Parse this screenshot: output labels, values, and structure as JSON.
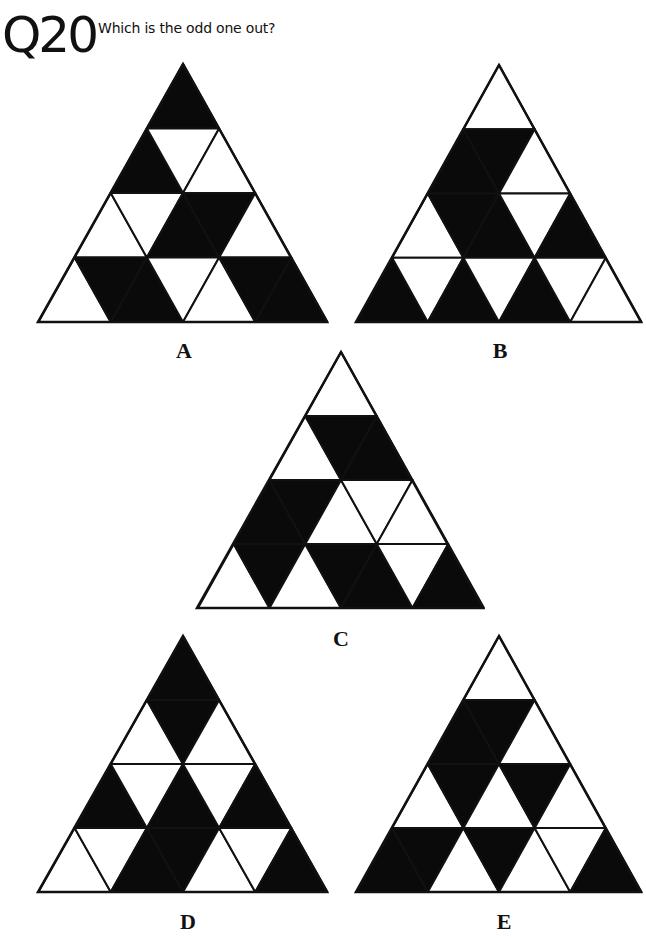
{
  "header": {
    "question_number": "Q20",
    "prompt": "Which is the odd one out?"
  },
  "colors": {
    "fill_black": "#0a0a0a",
    "fill_white": "#ffffff",
    "stroke": "#111111",
    "background": "#ffffff"
  },
  "fill_encoding": "rows top-to-bottom; each row lists cells left-to-right alternating up/down triangles; 1 = black, 0 = white",
  "options": [
    {
      "label": "A",
      "apex": [
        183,
        64
      ],
      "base_left": [
        38,
        322
      ],
      "base_right": [
        327,
        322
      ],
      "label_pos": [
        184,
        340
      ],
      "rows": [
        [
          1
        ],
        [
          1,
          0,
          0
        ],
        [
          0,
          0,
          1,
          1,
          0
        ],
        [
          0,
          1,
          1,
          0,
          0,
          1,
          1
        ]
      ]
    },
    {
      "label": "B",
      "apex": [
        499,
        65
      ],
      "base_left": [
        356,
        322
      ],
      "base_right": [
        641,
        322
      ],
      "label_pos": [
        500,
        340
      ],
      "rows": [
        [
          0
        ],
        [
          1,
          1,
          0
        ],
        [
          0,
          1,
          1,
          0,
          1
        ],
        [
          1,
          0,
          1,
          0,
          1,
          0,
          0
        ]
      ]
    },
    {
      "label": "C",
      "apex": [
        341,
        352
      ],
      "base_left": [
        197,
        608
      ],
      "base_right": [
        483,
        608
      ],
      "label_pos": [
        341,
        628
      ],
      "rows": [
        [
          0
        ],
        [
          0,
          1,
          1
        ],
        [
          1,
          1,
          0,
          0,
          0
        ],
        [
          0,
          1,
          0,
          1,
          1,
          0,
          1
        ]
      ]
    },
    {
      "label": "D",
      "apex": [
        183,
        636
      ],
      "base_left": [
        38,
        892
      ],
      "base_right": [
        327,
        892
      ],
      "label_pos": [
        188,
        911
      ],
      "rows": [
        [
          1
        ],
        [
          0,
          1,
          0
        ],
        [
          1,
          0,
          1,
          0,
          1
        ],
        [
          0,
          0,
          1,
          1,
          0,
          0,
          1
        ]
      ]
    },
    {
      "label": "E",
      "apex": [
        499,
        636
      ],
      "base_left": [
        356,
        892
      ],
      "base_right": [
        641,
        892
      ],
      "label_pos": [
        504,
        911
      ],
      "rows": [
        [
          0
        ],
        [
          1,
          1,
          0
        ],
        [
          0,
          1,
          0,
          1,
          0
        ],
        [
          1,
          1,
          0,
          1,
          0,
          0,
          1
        ]
      ]
    }
  ]
}
